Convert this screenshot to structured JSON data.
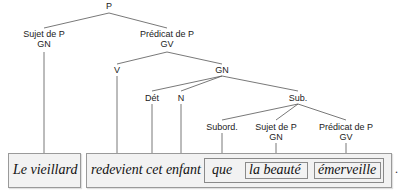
{
  "tree": {
    "root": {
      "label": "P"
    },
    "subject": {
      "line1": "Sujet de P",
      "line2": "GN"
    },
    "predicate": {
      "line1": "Prédicat de P",
      "line2": "GV"
    },
    "verb": {
      "label": "V"
    },
    "gn": {
      "label": "GN"
    },
    "det": {
      "label": "Dét"
    },
    "noun": {
      "label": "N"
    },
    "sub": {
      "label": "Sub."
    },
    "subord": {
      "label": "Subord."
    },
    "sub_subject": {
      "line1": "Sujet de P",
      "line2": "GN"
    },
    "sub_predicate": {
      "line1": "Prédicat de P",
      "line2": "GV"
    }
  },
  "sentence": {
    "subject_text": "Le vieillard",
    "predicate_text": "redevient cet enfant",
    "subord_text": "que",
    "sub_subject_text": "la beauté",
    "sub_predicate_text": "émerveille",
    "period": "."
  }
}
